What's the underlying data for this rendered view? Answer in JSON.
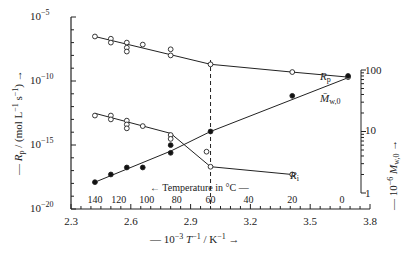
{
  "chart_data": {
    "type": "scatter",
    "title": "",
    "xlabel": "10^-3 T^-1 / K^-1",
    "ylabel_left": "R_p / (mol L^-1 s^-1)",
    "ylabel_right": "10^-6 M_w,0",
    "xlim": [
      2.3,
      3.8
    ],
    "ylim_left": [
      1e-20,
      1e-05
    ],
    "ylim_right": [
      1,
      100
    ],
    "x_ticks": [
      "2.3",
      "2.6",
      "2.9",
      "3.2",
      "3.5",
      "3.8"
    ],
    "y_ticks_left": [
      "10^-5",
      "10^-10",
      "10^-15",
      "10^-20"
    ],
    "y_ticks_right": [
      "100",
      "10",
      "1"
    ],
    "temperature_axis": {
      "label": "Temperature in °C",
      "ticks": [
        "140",
        "120",
        "100",
        "80",
        "60",
        "40",
        "20",
        "0"
      ],
      "x_positions": [
        2.42,
        2.54,
        2.68,
        2.83,
        3.0,
        3.19,
        3.41,
        3.66
      ]
    },
    "dashed_line_x": 3.0,
    "series": [
      {
        "name": "R_p",
        "axis": "left",
        "marker": "open-circle",
        "points": [
          [
            2.42,
            3e-07
          ],
          [
            2.5,
            2e-07
          ],
          [
            2.5,
            1e-07
          ],
          [
            2.58,
            1e-07
          ],
          [
            2.58,
            4e-08
          ],
          [
            2.58,
            2e-08
          ],
          [
            2.66,
            7e-08
          ],
          [
            2.8,
            3e-08
          ],
          [
            2.8,
            1e-08
          ],
          [
            3.0,
            2e-09
          ],
          [
            3.41,
            5e-10
          ],
          [
            3.69,
            2e-10
          ]
        ],
        "line": [
          [
            2.42,
            3e-07
          ],
          [
            3.0,
            2e-09
          ],
          [
            3.41,
            5e-10
          ],
          [
            3.69,
            2e-10
          ]
        ]
      },
      {
        "name": "R_i",
        "axis": "left",
        "marker": "open-circle",
        "points": [
          [
            2.42,
            2e-13
          ],
          [
            2.5,
            2e-13
          ],
          [
            2.5,
            1e-13
          ],
          [
            2.58,
            8e-14
          ],
          [
            2.58,
            4e-14
          ],
          [
            2.58,
            2e-14
          ],
          [
            2.66,
            3e-14
          ],
          [
            2.8,
            6e-15
          ],
          [
            2.8,
            3e-15
          ],
          [
            2.98,
            3e-16
          ],
          [
            3.0,
            2e-17
          ],
          [
            3.41,
            5e-18
          ]
        ],
        "line": [
          [
            2.42,
            3e-13
          ],
          [
            2.8,
            8e-15
          ],
          [
            3.0,
            2e-17
          ],
          [
            3.41,
            5e-18
          ]
        ]
      },
      {
        "name": "M_w,0",
        "axis": "right",
        "marker": "filled-circle",
        "points": [
          [
            2.42,
            1.5
          ],
          [
            2.5,
            2.0
          ],
          [
            2.58,
            2.6
          ],
          [
            2.66,
            2.6
          ],
          [
            2.8,
            4.5
          ],
          [
            2.8,
            6
          ],
          [
            3.0,
            10
          ],
          [
            3.41,
            38
          ],
          [
            3.69,
            80
          ]
        ],
        "line": [
          [
            2.42,
            1.5
          ],
          [
            2.8,
            4.8
          ],
          [
            3.0,
            10
          ],
          [
            3.69,
            75
          ]
        ]
      }
    ],
    "annotations": [
      "R_p",
      "M_w,0",
      "R_i"
    ],
    "grid": false,
    "legend": "none (inline labels)"
  }
}
